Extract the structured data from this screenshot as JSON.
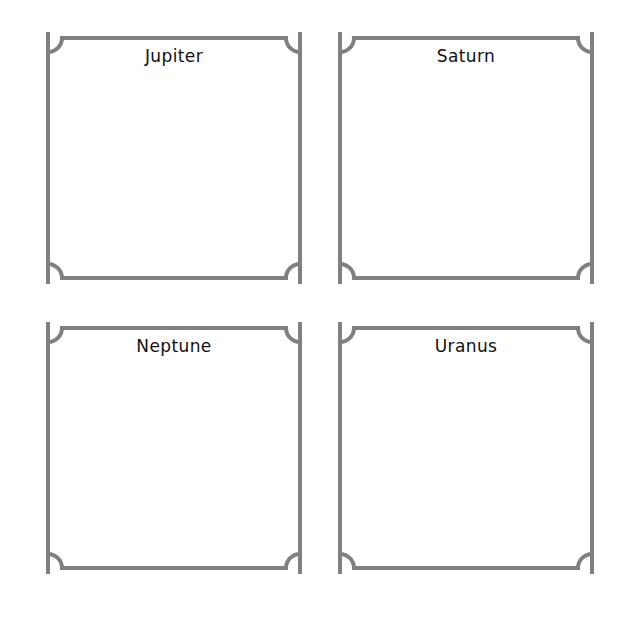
{
  "page": {
    "background_color": "#ffffff",
    "width": 638,
    "height": 621
  },
  "style": {
    "frame_stroke_color": "#808080",
    "frame_stroke_width": 4,
    "frame_fill_color": "#ffffff",
    "label_color": "#101010"
  },
  "boxes": [
    {
      "label": "Jupiter",
      "row": 0,
      "column": 0,
      "content": ""
    },
    {
      "label": "Saturn",
      "row": 0,
      "column": 1,
      "content": ""
    },
    {
      "label": "Neptune",
      "row": 1,
      "column": 0,
      "content": ""
    },
    {
      "label": "Uranus",
      "row": 1,
      "column": 1,
      "content": ""
    }
  ]
}
